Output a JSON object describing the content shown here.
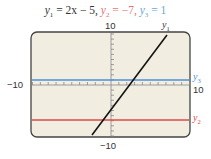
{
  "chart_data": {
    "type": "line",
    "title": "y1 = 2x − 5,  y2 = −7,  y3 = 1",
    "xlabel": "",
    "ylabel": "",
    "xlim": [
      -10,
      10
    ],
    "ylim": [
      -10,
      10
    ],
    "grid": false,
    "series": [
      {
        "name": "y1",
        "equation": "2x - 5",
        "color": "#111111",
        "x": [
          -2.5,
          7.5
        ],
        "values": [
          -10,
          10
        ]
      },
      {
        "name": "y2",
        "equation": "-7",
        "color": "#e0494e",
        "x": [
          -10,
          10
        ],
        "values": [
          -7,
          -7
        ]
      },
      {
        "name": "y3",
        "equation": "1",
        "color": "#4a90d9",
        "x": [
          -10,
          10
        ],
        "values": [
          1,
          1
        ]
      }
    ],
    "tick_labels": {
      "x_min": "−10",
      "x_max": "10",
      "y_max": "10",
      "y_min": "−10"
    },
    "legend_position": "right-edge inline labels"
  },
  "title": {
    "y1_name": "y",
    "y1_sub": "1",
    "y1_expr": " = 2x − 5,  ",
    "y2_name": "y",
    "y2_sub": "2",
    "y2_expr": " = −7,  ",
    "y3_name": "y",
    "y3_sub": "3",
    "y3_expr": " = 1"
  },
  "axis_labels": {
    "x_min": "−10",
    "x_max": "10",
    "y_max": "10",
    "y_min": "−10"
  },
  "series_labels": {
    "y1": {
      "name": "y",
      "sub": "1"
    },
    "y2": {
      "name": "y",
      "sub": "2"
    },
    "y3": {
      "name": "y",
      "sub": "3"
    }
  },
  "colors": {
    "background": "#f2ede1",
    "frame": "#444444",
    "y1": "#111111",
    "y2": "#e0494e",
    "y3": "#4a90d9"
  }
}
